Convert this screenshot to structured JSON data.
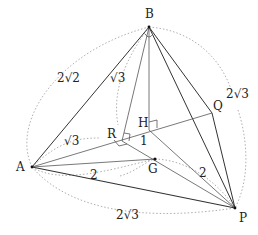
{
  "diagram": {
    "type": "tetrahedron",
    "points": {
      "A": {
        "label": "A",
        "x": 32,
        "y": 167
      },
      "B": {
        "label": "B",
        "x": 149,
        "y": 27
      },
      "P": {
        "label": "P",
        "x": 235,
        "y": 208
      },
      "Q": {
        "label": "Q",
        "x": 212,
        "y": 113
      },
      "H": {
        "label": "H",
        "x": 149,
        "y": 130
      },
      "R": {
        "label": "R",
        "x": 122,
        "y": 141
      },
      "G": {
        "label": "G",
        "x": 155,
        "y": 159
      }
    },
    "edge_labels": {
      "AB": "2√2",
      "BR": "√3",
      "AR": "√3",
      "BQ_PQ": "2√3",
      "AP": "2√3",
      "AG": "2",
      "GP": "2",
      "RH": "1"
    }
  }
}
